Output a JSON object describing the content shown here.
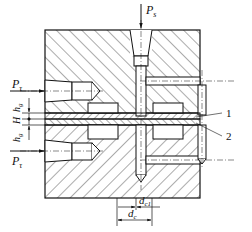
{
  "diagram": {
    "type": "engineering cross-section",
    "labels": {
      "ps": "P",
      "ps_sub": "s",
      "pt_top": "P",
      "pt_top_sub": "τ",
      "pt_bottom": "P",
      "pt_bottom_sub": "τ",
      "hg_top": "h",
      "hg_top_sub": "g",
      "H": "H",
      "hg_bottom": "h",
      "hg_bottom_sub": "g",
      "dc1": "d",
      "dc1_sub": "c1",
      "dc": "d",
      "dc_sub": "c",
      "callout_1": "1",
      "callout_2": "2"
    },
    "colors": {
      "line": "#111111",
      "background": "#ffffff"
    }
  }
}
